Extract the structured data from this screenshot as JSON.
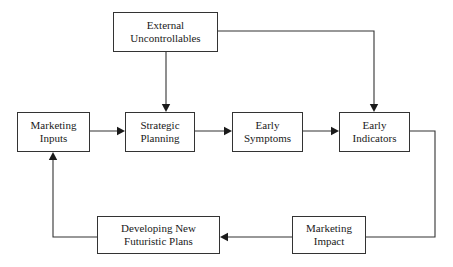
{
  "diagram": {
    "background_color": "#ffffff",
    "line_color": "#333333",
    "text_color": "#1a1a1a",
    "nodes": [
      {
        "id": "external-uncontrollables",
        "label": "External\nUncontrollables",
        "x": 113,
        "y": 12,
        "w": 105,
        "h": 40
      },
      {
        "id": "marketing-inputs",
        "label": "Marketing\nInputs",
        "x": 17,
        "y": 112,
        "w": 73,
        "h": 40
      },
      {
        "id": "strategic-planning",
        "label": "Strategic\nPlanning",
        "x": 125,
        "y": 112,
        "w": 70,
        "h": 40
      },
      {
        "id": "early-symptoms",
        "label": "Early\nSymptoms",
        "x": 232,
        "y": 112,
        "w": 71,
        "h": 40
      },
      {
        "id": "early-indicators",
        "label": "Early\nIndicators",
        "x": 339,
        "y": 112,
        "w": 71,
        "h": 40
      },
      {
        "id": "developing-new-futuristic-plans",
        "label": "Developing New\nFuturistic Plans",
        "x": 97,
        "y": 216,
        "w": 123,
        "h": 38
      },
      {
        "id": "marketing-impact",
        "label": "Marketing\nImpact",
        "x": 292,
        "y": 216,
        "w": 74,
        "h": 38
      }
    ],
    "connectors": [
      {
        "id": "external-to-strategic-planning",
        "from": "external-uncontrollables",
        "to": "strategic-planning",
        "path": "M 166 52 L 166 110",
        "arrow": "down",
        "arrow_at": [
          166,
          112
        ]
      },
      {
        "id": "external-to-early-indicators",
        "from": "external-uncontrollables",
        "to": "early-indicators",
        "path": "M 218 31 L 374 31 L 374 110",
        "arrow": "down",
        "arrow_at": [
          374,
          112
        ]
      },
      {
        "id": "marketing-inputs-to-strategic-planning",
        "from": "marketing-inputs",
        "to": "strategic-planning",
        "path": "M 90 131 L 123 131",
        "arrow": "right",
        "arrow_at": [
          125,
          131
        ]
      },
      {
        "id": "strategic-planning-to-early-symptoms",
        "from": "strategic-planning",
        "to": "early-symptoms",
        "path": "M 195 131 L 230 131",
        "arrow": "right",
        "arrow_at": [
          232,
          131
        ]
      },
      {
        "id": "early-symptoms-to-early-indicators",
        "from": "early-symptoms",
        "to": "early-indicators",
        "path": "M 303 131 L 337 131",
        "arrow": "right",
        "arrow_at": [
          339,
          131
        ]
      },
      {
        "id": "early-indicators-to-marketing-impact",
        "from": "early-indicators",
        "to": "marketing-impact",
        "path": "M 410 131 L 435 131 L 435 237 L 366 237",
        "arrow": "none"
      },
      {
        "id": "marketing-impact-to-developing-plans",
        "from": "marketing-impact",
        "to": "developing-new-futuristic-plans",
        "path": "M 292 237 L 222 237",
        "arrow": "left",
        "arrow_at": [
          220,
          237
        ]
      },
      {
        "id": "developing-plans-to-marketing-inputs",
        "from": "developing-new-futuristic-plans",
        "to": "marketing-inputs",
        "path": "M 97 237 L 53 237 L 53 154",
        "arrow": "up",
        "arrow_at": [
          53,
          152
        ]
      }
    ]
  }
}
